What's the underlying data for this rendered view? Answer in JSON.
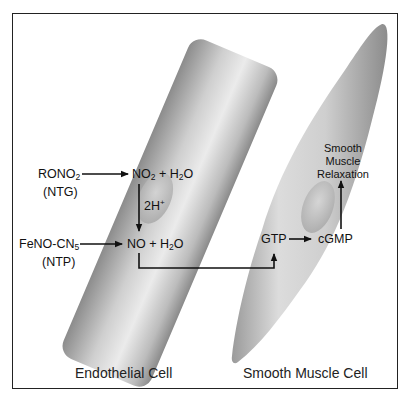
{
  "diagram": {
    "cells": [
      {
        "name": "Endothelial Cell",
        "shape": "rounded-rectangle"
      },
      {
        "name": "Smooth Muscle Cell",
        "shape": "spindle"
      }
    ],
    "captions": {
      "endothelial": "Endothelial Cell",
      "smooth_muscle": "Smooth Muscle Cell"
    },
    "inputs": {
      "rono2": {
        "main": "RONO",
        "sub": "2",
        "abbr": "(NTG)"
      },
      "fenocn5": {
        "main": "FeNO-CN",
        "sub": "5",
        "abbr": "(NTP)"
      }
    },
    "species": {
      "no2_h2o": {
        "a": "NO",
        "a_sub": "2",
        "plus": " + H",
        "b_sub": "2",
        "b_end": "O"
      },
      "conversion": {
        "main": "2H",
        "sup": "+"
      },
      "no_h2o": {
        "a": "NO + H",
        "a_sub": "2",
        "b_end": "O"
      },
      "gtp": "GTP",
      "cgmp": "cGMP",
      "result_line1": "Smooth",
      "result_line2": "Muscle",
      "result_line3": "Relaxation"
    },
    "arrows": [
      "RONO2 -> NO2 + H2O",
      "NO2 + H2O -> NO + H2O (2H+)",
      "FeNO-CN5 -> NO + H2O",
      "NO + H2O -> GTP",
      "GTP -> cGMP",
      "cGMP -> Smooth Muscle Relaxation"
    ],
    "colors": {
      "border": "#222222",
      "cell_light": "#ececec",
      "cell_dark": "#8f8f8f",
      "arrow": "#111111"
    }
  }
}
